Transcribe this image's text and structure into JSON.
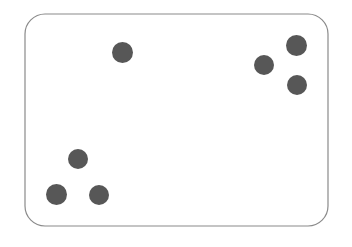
{
  "canvas": {
    "width": 352,
    "height": 247,
    "background_color": "#ffffff"
  },
  "card": {
    "label": "rounded-rectangle-card",
    "x": 25,
    "y": 14,
    "width": 303,
    "height": 212,
    "corner_radius": 20,
    "fill_color": "#ffffff",
    "border_color": "#8a8a8a",
    "border_width": 1.2
  },
  "chart_data": {
    "type": "scatter",
    "title": "",
    "subtitle": "",
    "xlabel": "",
    "ylabel": "",
    "grid": false,
    "legend": "none",
    "axes_visible": false,
    "tick_labels": [],
    "annotations": [],
    "xlim": [
      25,
      328
    ],
    "ylim": [
      14,
      226
    ],
    "marker": {
      "shape": "circle",
      "diameter": 21,
      "fill_color": "#575757",
      "edge_color": "#575757"
    },
    "point_count": 7,
    "series": [
      {
        "name": "dots",
        "color": "#575757",
        "points": [
          {
            "id": "dot-1",
            "group": "top-center",
            "x": 122,
            "y": 52,
            "d": 21
          },
          {
            "id": "dot-2",
            "group": "top-right",
            "x": 296,
            "y": 45,
            "d": 21
          },
          {
            "id": "dot-3",
            "group": "top-right",
            "x": 264,
            "y": 65,
            "d": 20
          },
          {
            "id": "dot-4",
            "group": "top-right",
            "x": 297,
            "y": 85,
            "d": 20
          },
          {
            "id": "dot-5",
            "group": "bottom-left",
            "x": 78,
            "y": 159,
            "d": 20
          },
          {
            "id": "dot-6",
            "group": "bottom-left",
            "x": 56,
            "y": 194,
            "d": 21
          },
          {
            "id": "dot-7",
            "group": "bottom-left",
            "x": 99,
            "y": 195,
            "d": 20
          }
        ]
      }
    ]
  }
}
